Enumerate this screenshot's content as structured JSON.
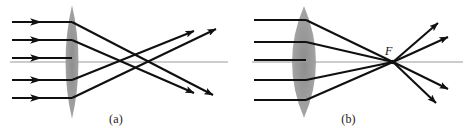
{
  "figure": {
    "background_color": "#ffffff",
    "width": 465,
    "height": 130
  },
  "style": {
    "ray_color": "#101010",
    "axis_color": "#9a9a9a",
    "lens_fill": "#9d9d9d",
    "lens_fill_light": "#b4b4b4",
    "label_color": "#101010",
    "ray_width": 2.1,
    "axis_width": 1.2
  },
  "panels": [
    {
      "id": "a",
      "caption": "(a)",
      "description": "Parallel rays through a thin lens exhibiting spherical aberration; outer rays cross the axis nearer the lens than inner rays, so there is no single focal point.",
      "lens": {
        "name": "thin-biconvex-lens",
        "center_x": 72,
        "half_height": 57,
        "half_width": 13,
        "shape": "biconvex-pointed"
      },
      "axis": {
        "y": 62,
        "x1": 10,
        "x2": 228
      },
      "incoming_rays": [
        {
          "y": 22,
          "x1": 12,
          "x2": 72,
          "arrow_x": 36
        },
        {
          "y": 40,
          "x1": 12,
          "x2": 72,
          "arrow_x": 36
        },
        {
          "y": 58,
          "x1": 12,
          "x2": 72,
          "arrow_x": 36
        },
        {
          "y": 80,
          "x1": 12,
          "x2": 72,
          "arrow_x": 36
        },
        {
          "y": 98,
          "x1": 12,
          "x2": 72,
          "arrow_x": 36
        }
      ],
      "outgoing_rays": [
        {
          "x1": 72,
          "y1": 22,
          "x2": 215,
          "y2": 96,
          "arrow_t": 0.93
        },
        {
          "x1": 72,
          "y1": 40,
          "x2": 196,
          "y2": 94,
          "arrow_t": 0.93
        },
        {
          "x1": 72,
          "y1": 80,
          "x2": 196,
          "y2": 30,
          "arrow_t": 0.93
        },
        {
          "x1": 72,
          "y1": 98,
          "x2": 218,
          "y2": 28,
          "arrow_t": 0.93
        }
      ],
      "crossing_points": [
        {
          "x": 126,
          "y": 62,
          "label": "outer-ray-crossing"
        },
        {
          "x": 156,
          "y": 62,
          "label": "inner-ray-crossing"
        }
      ]
    },
    {
      "id": "b",
      "caption": "(b)",
      "description": "Parallel rays through an ideal thick converging lens all meeting at the single focal point F.",
      "lens": {
        "name": "thick-biconvex-lens",
        "center_x": 72,
        "half_height": 56,
        "half_width": 22,
        "shape": "biconvex-rounded"
      },
      "axis": {
        "y": 62,
        "x1": 20,
        "x2": 230
      },
      "incoming_rays": [
        {
          "y": 20,
          "x1": 22,
          "x2": 72
        },
        {
          "y": 42,
          "x1": 22,
          "x2": 72
        },
        {
          "y": 60,
          "x1": 22,
          "x2": 72
        },
        {
          "y": 80,
          "x1": 22,
          "x2": 72
        },
        {
          "y": 100,
          "x1": 22,
          "x2": 72
        }
      ],
      "focal_point": {
        "x": 161,
        "y": 62,
        "label": "F",
        "label_x": 156,
        "label_y": 52
      },
      "outgoing_rays": [
        {
          "x1": 161,
          "y1": 62,
          "x2": 208,
          "y2": 22,
          "arrow_t": 0.92
        },
        {
          "x1": 161,
          "y1": 62,
          "x2": 218,
          "y2": 36,
          "arrow_t": 0.92
        },
        {
          "x1": 161,
          "y1": 62,
          "x2": 218,
          "y2": 90,
          "arrow_t": 0.92
        },
        {
          "x1": 161,
          "y1": 62,
          "x2": 206,
          "y2": 104,
          "arrow_t": 0.92
        }
      ]
    }
  ]
}
